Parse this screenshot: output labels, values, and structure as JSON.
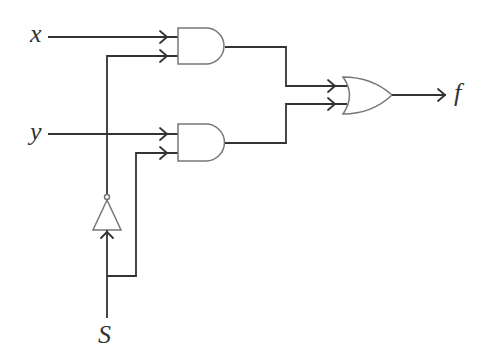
{
  "diagram": {
    "type": "logic-circuit",
    "inputs": [
      {
        "id": "x",
        "label": "x"
      },
      {
        "id": "y",
        "label": "y"
      },
      {
        "id": "S",
        "label": "S"
      }
    ],
    "outputs": [
      {
        "id": "f",
        "label": "f"
      }
    ],
    "gates": [
      {
        "id": "not1",
        "type": "NOT",
        "inputs": [
          "S"
        ]
      },
      {
        "id": "and1",
        "type": "AND",
        "inputs": [
          "x",
          "not1"
        ]
      },
      {
        "id": "and2",
        "type": "AND",
        "inputs": [
          "y",
          "S"
        ]
      },
      {
        "id": "or1",
        "type": "OR",
        "inputs": [
          "and1",
          "and2"
        ],
        "output": "f"
      }
    ],
    "colors": {
      "line": "#333333",
      "gate_outline": "#777777",
      "background": "#ffffff"
    }
  }
}
